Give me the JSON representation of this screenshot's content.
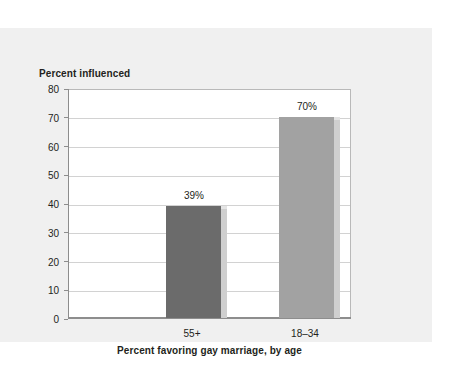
{
  "chart_data": {
    "type": "bar",
    "title": "",
    "ylabel": "Percent influenced",
    "xlabel": "Percent favoring gay marriage, by age",
    "categories": [
      "55+",
      "18–34"
    ],
    "values": [
      39,
      70
    ],
    "data_labels": [
      "39%",
      "70%"
    ],
    "ylim": [
      0,
      80
    ],
    "yticks": [
      {
        "value": 80,
        "label": "80"
      },
      {
        "value": 70,
        "label": "70"
      },
      {
        "value": 60,
        "label": "60"
      },
      {
        "value": 50,
        "label": "50"
      },
      {
        "value": 40,
        "label": "40"
      },
      {
        "value": 30,
        "label": "30"
      },
      {
        "value": 20,
        "label": "20"
      },
      {
        "value": 10,
        "label": "10"
      },
      {
        "value": 0,
        "label": "0"
      }
    ],
    "grid": true,
    "legend": "none",
    "bar_colors": [
      "#6b6b6b",
      "#a2a2a2"
    ],
    "bar_side_color": "#cfcfcf",
    "plot_background": "#ffffff",
    "panel_background": "#f0f0f0",
    "page_background": "#ffffff",
    "axis_color": "#8d8d8d",
    "gridline_color": "#d2d2d2",
    "text_color": "#231f20"
  }
}
